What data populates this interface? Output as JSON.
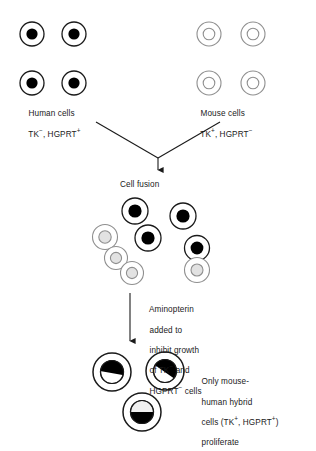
{
  "diagram": {
    "colors": {
      "stroke_dark": "#1a1a1a",
      "stroke_light": "#9a9a9a",
      "nucleus_human": "#000000",
      "nucleus_mouse_fill": "#ffffff",
      "nucleus_mouse_stroke": "#9a9a9a",
      "background": "#ffffff"
    },
    "labels": {
      "human_cells": {
        "line1": "Human cells",
        "line2_prefix": "TK",
        "line2_sup1": "−",
        "line2_mid": ", HGPRT",
        "line2_sup2": "+"
      },
      "mouse_cells": {
        "line1": "Mouse cells",
        "line2_prefix": "TK",
        "line2_sup1": "+",
        "line2_mid": ", HGPRT",
        "line2_sup2": "−"
      },
      "cell_fusion": "Cell fusion",
      "aminopterin": {
        "line1": "Aminopterin",
        "line2": "added to",
        "line3": "inhibit growth",
        "line4_prefix": "of TK",
        "line4_sup": "−",
        "line4_suffix": " and",
        "line5_prefix": "HGPRT",
        "line5_sup": "−",
        "line5_suffix": " cells"
      },
      "hybrid_result": {
        "line1": "Only mouse-",
        "line2": "human hybrid",
        "line3_prefix": "cells (TK",
        "line3_sup1": "+",
        "line3_mid": ", HGPRT",
        "line3_sup2": "+",
        "line3_suffix": ")",
        "line4": "proliferate"
      }
    },
    "human_cells_group": {
      "count": 4,
      "nucleus_type": "solid-black",
      "cells": [
        {
          "cx": 32,
          "cy": 34
        },
        {
          "cx": 74,
          "cy": 34
        },
        {
          "cx": 32,
          "cy": 83
        },
        {
          "cx": 74,
          "cy": 83
        }
      ]
    },
    "mouse_cells_group": {
      "count": 4,
      "nucleus_type": "open-gray",
      "cells": [
        {
          "cx": 209,
          "cy": 34
        },
        {
          "cx": 253,
          "cy": 34
        },
        {
          "cx": 209,
          "cy": 83
        },
        {
          "cx": 253,
          "cy": 83
        }
      ]
    },
    "fusion_mixture": {
      "count": 6,
      "cells": [
        {
          "cx": 135,
          "cy": 211,
          "type": "human"
        },
        {
          "cx": 183,
          "cy": 216,
          "type": "human"
        },
        {
          "cx": 148,
          "cy": 238,
          "type": "human"
        },
        {
          "cx": 105,
          "cy": 237,
          "type": "mouse"
        },
        {
          "cx": 122,
          "cy": 265,
          "type": "mouse-doublet"
        },
        {
          "cx": 197,
          "cy": 258,
          "type": "fused-doublet"
        }
      ]
    },
    "hybrid_cells_group": {
      "count": 3,
      "nucleus_type": "half-black-half-white",
      "cells": [
        {
          "cx": 112,
          "cy": 372,
          "angle": 10
        },
        {
          "cx": 165,
          "cy": 371,
          "angle": 35
        },
        {
          "cx": 142,
          "cy": 412,
          "angle": 0
        }
      ]
    }
  }
}
